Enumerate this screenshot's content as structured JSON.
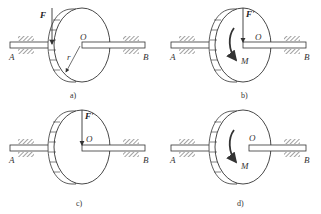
{
  "figure": {
    "panels": [
      {
        "id": "a",
        "caption": "a)",
        "labels": {
          "force": "F",
          "center": "O",
          "radius": "r",
          "left_bearing": "A",
          "right_bearing": "B"
        }
      },
      {
        "id": "b",
        "caption": "b)",
        "labels": {
          "force": "F'",
          "center": "O",
          "moment": "M",
          "left_bearing": "A",
          "right_bearing": "B"
        }
      },
      {
        "id": "c",
        "caption": "c)",
        "labels": {
          "force": "F'",
          "center": "O",
          "left_bearing": "A",
          "right_bearing": "B"
        }
      },
      {
        "id": "d",
        "caption": "d)",
        "labels": {
          "center": "O",
          "moment": "M",
          "left_bearing": "A",
          "right_bearing": "B"
        }
      }
    ],
    "colors": {
      "line": "#333333",
      "fill": "#ffffff"
    }
  }
}
